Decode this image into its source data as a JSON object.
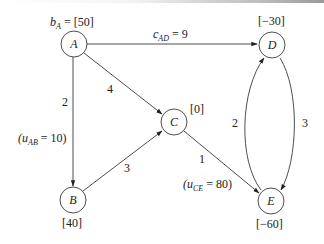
{
  "diagram": {
    "type": "network-flow",
    "nodes": [
      {
        "id": "A",
        "label": "A",
        "supply_label": "b_A = [50]",
        "supply_prefix": "b",
        "supply_sub": "A",
        "supply_value": "= [50]"
      },
      {
        "id": "B",
        "label": "B",
        "supply_label": "[40]"
      },
      {
        "id": "C",
        "label": "C",
        "supply_label": "[0]"
      },
      {
        "id": "D",
        "label": "D",
        "supply_label": "[−30]"
      },
      {
        "id": "E",
        "label": "E",
        "supply_label": "[−60]"
      }
    ],
    "edges": [
      {
        "from": "A",
        "to": "D",
        "cost": "9",
        "cost_label_prefix": "c",
        "cost_label_sub": "AD",
        "cost_label_value": "= 9"
      },
      {
        "from": "A",
        "to": "C",
        "cost": "4"
      },
      {
        "from": "A",
        "to": "B",
        "cost": "2",
        "capacity_prefix": "(u",
        "capacity_sub": "AB",
        "capacity_value": "= 10)"
      },
      {
        "from": "B",
        "to": "C",
        "cost": "3"
      },
      {
        "from": "C",
        "to": "E",
        "cost": "1",
        "capacity_prefix": "(u",
        "capacity_sub": "CE",
        "capacity_value": "= 80)"
      },
      {
        "from": "E",
        "to": "D",
        "cost": "2"
      },
      {
        "from": "D",
        "to": "E",
        "cost": "3"
      }
    ]
  }
}
